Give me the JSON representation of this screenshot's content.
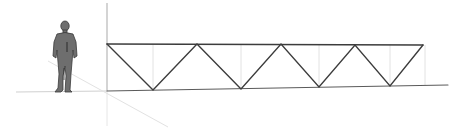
{
  "scene": {
    "background": "#ffffff",
    "description": "3D modeling viewport showing a Warren truss beside a human scale figure",
    "colors": {
      "truss_member": "#3c3c3c",
      "vertical_guide": "#d6d6d6",
      "axis_vertical": "#b8b8b8",
      "axis_horizontal": "#d0d0d0",
      "axis_diagonal": "#e2e2e2",
      "figure_fill": "#6e6e6e",
      "figure_outline": "#3a3a3a"
    }
  },
  "truss": {
    "type": "warren",
    "top_chord": {
      "x1": 107,
      "y1": 44,
      "x2": 423,
      "y2": 45
    },
    "bottom_chord": {
      "x1": 107,
      "y1": 91,
      "x2": 448,
      "y2": 85
    },
    "top_nodes": [
      [
        107,
        44
      ],
      [
        197,
        44
      ],
      [
        281,
        44
      ],
      [
        355,
        45
      ],
      [
        423,
        45
      ]
    ],
    "bottom_nodes": [
      [
        153,
        90
      ],
      [
        241,
        89
      ],
      [
        319,
        87
      ],
      [
        390,
        86
      ]
    ],
    "vertical_guides_x": [
      153,
      241,
      319,
      390,
      425
    ]
  },
  "figure": {
    "label": "scale-figure",
    "x": 65,
    "feet_y": 92
  }
}
